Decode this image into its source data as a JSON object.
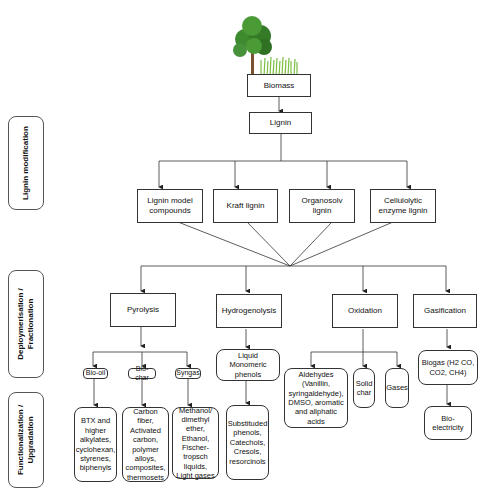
{
  "stages": [
    {
      "id": "lignin-modification",
      "label": "Lignin modification"
    },
    {
      "id": "deploymerisation",
      "label": "Deploymerisation /\nFractionation"
    },
    {
      "id": "functionalization",
      "label": "Functionalization /\nUpgradation"
    }
  ],
  "top": {
    "biomass": "Biomass",
    "lignin": "Lignin",
    "biomass_icon": "tree-and-grass-icon"
  },
  "lignin_types": [
    "Lignin model compounds",
    "Kraft lignin",
    "Organosolv lignin",
    "Cellulolytic enzyme lignin"
  ],
  "processes": [
    "Pyrolysis",
    "Hydrogenolysis",
    "Oxidation",
    "Gasification"
  ],
  "pyrolysis": {
    "products": [
      "Bio-oil",
      "Bio-char",
      "Syngas"
    ],
    "upgrades": [
      "BTX and higher alkylates, cyclohexan, styrenes, biphenyls",
      "Carbon fiber, Activated carbon, polymer alloys, composites, thermosets",
      "Methanol/ dimethyl ether, Ethanol, Fischer-tropsch liquids, Light gases"
    ]
  },
  "hydrogenolysis": {
    "product": "Liquid Monomeric phenols",
    "upgrade": "Substituded phenols, Catechols, Cresols, resorcinols"
  },
  "oxidation": {
    "products": [
      "Aldehydes (Vanillin, syringaldehyde), DMSO, aromatic and aliphatic acids",
      "Solid char",
      "Gases"
    ]
  },
  "gasification": {
    "product": "Biogas (H2 CO, CO2, CH4)",
    "upgrade": "Bio-electricity"
  },
  "colors": {
    "line": "#333333",
    "tree_foliage": "#3e8a2e",
    "tree_trunk": "#7a5230",
    "grass": "#7bc043"
  }
}
